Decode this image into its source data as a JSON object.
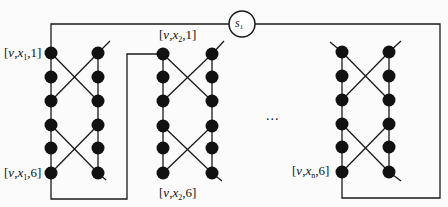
{
  "diagram": {
    "type": "gadget-chain",
    "colors": {
      "stroke": "#1a1a1a",
      "node": "#111111",
      "background": "#fbfbfb"
    },
    "source_node": {
      "var": "s",
      "sub": "1"
    },
    "ellipsis": "...",
    "rows_per_column": 6,
    "gadgets": [
      {
        "id": "x1",
        "top_label": {
          "v": "v",
          "x": "x",
          "sub": "1",
          "n": "1"
        },
        "bottom_label": {
          "v": "v",
          "x": "x",
          "sub": "1",
          "n": "6"
        }
      },
      {
        "id": "x2",
        "top_label": {
          "v": "v",
          "x": "x",
          "sub": "2",
          "n": "1"
        },
        "bottom_label": {
          "v": "v",
          "x": "x",
          "sub": "2",
          "n": "6"
        }
      },
      {
        "id": "xn",
        "bottom_label": {
          "v": "v",
          "x": "x",
          "sub": "n",
          "n": "6"
        }
      }
    ]
  }
}
